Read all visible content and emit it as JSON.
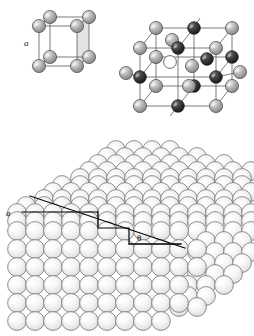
{
  "figure": {
    "name": "crystal-structure-figure",
    "background_color": "#ffffff",
    "width": 254,
    "height": 336
  },
  "panels": [
    {
      "id": "simple-cubic-cell",
      "title": "",
      "lattice_label": "a",
      "atom_count": 8,
      "atom_color": "#a8a8a8",
      "atom_highlight": "#e8e8e8",
      "edge_color": "#555555",
      "shaded_face_color": "#d9d9d9"
    },
    {
      "id": "binary-cubic-cell",
      "title": "",
      "light_atom_color": "#b5b5b5",
      "dark_atom_color": "#3a3a3a",
      "vacancy_color": "#ffffff",
      "vacancy_outline": "#555555",
      "edge_color": "#555555",
      "light_atom_count": 12,
      "dark_atom_count": 8,
      "vacancy_count": 1
    },
    {
      "id": "vicinal-stepped-surface",
      "title": "",
      "step_label": "a",
      "angle_label": "θ",
      "sphere_fill": "#f2f2f2",
      "sphere_highlight": "#ffffff",
      "sphere_outline": "#6e6e6e",
      "annotation_color": "#000000",
      "rows_front": 6,
      "cols_front": 11,
      "terrace_rows": 7
    }
  ],
  "annotations": {
    "lattice_constant": "a",
    "miscut_angle": "θ",
    "step_height_label": "a"
  }
}
